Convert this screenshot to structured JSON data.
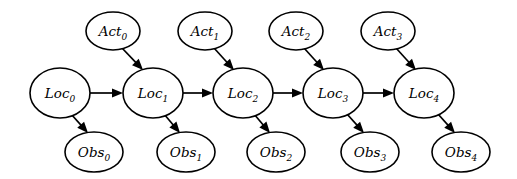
{
  "diagram": {
    "type": "directed-graphical-model",
    "background_color": "#ffffff",
    "stroke_color": "#000000",
    "node_fill": "#ffffff",
    "timesteps": 5
  },
  "nodes": {
    "locations": [
      {
        "id": "loc0",
        "base": "Loc",
        "sub": "0",
        "cx": 60,
        "cy": 93,
        "rx": 30,
        "ry": 25
      },
      {
        "id": "loc1",
        "base": "Loc",
        "sub": "1",
        "cx": 153,
        "cy": 93,
        "rx": 30,
        "ry": 25
      },
      {
        "id": "loc2",
        "base": "Loc",
        "sub": "2",
        "cx": 243,
        "cy": 93,
        "rx": 30,
        "ry": 25
      },
      {
        "id": "loc3",
        "base": "Loc",
        "sub": "3",
        "cx": 333,
        "cy": 93,
        "rx": 30,
        "ry": 25
      },
      {
        "id": "loc4",
        "base": "Loc",
        "sub": "4",
        "cx": 424,
        "cy": 93,
        "rx": 30,
        "ry": 25
      }
    ],
    "actions": [
      {
        "id": "act0",
        "base": "Act",
        "sub": "0",
        "cx": 113,
        "cy": 31,
        "rx": 27,
        "ry": 19
      },
      {
        "id": "act1",
        "base": "Act",
        "sub": "1",
        "cx": 205,
        "cy": 31,
        "rx": 27,
        "ry": 19
      },
      {
        "id": "act2",
        "base": "Act",
        "sub": "2",
        "cx": 296,
        "cy": 31,
        "rx": 27,
        "ry": 19
      },
      {
        "id": "act3",
        "base": "Act",
        "sub": "3",
        "cx": 388,
        "cy": 31,
        "rx": 27,
        "ry": 19
      }
    ],
    "observations": [
      {
        "id": "obs0",
        "base": "Obs",
        "sub": "0",
        "cx": 94,
        "cy": 152,
        "rx": 29,
        "ry": 20
      },
      {
        "id": "obs1",
        "base": "Obs",
        "sub": "1",
        "cx": 186,
        "cy": 152,
        "rx": 29,
        "ry": 20
      },
      {
        "id": "obs2",
        "base": "Obs",
        "sub": "2",
        "cx": 276,
        "cy": 152,
        "rx": 29,
        "ry": 20
      },
      {
        "id": "obs3",
        "base": "Obs",
        "sub": "3",
        "cx": 370,
        "cy": 152,
        "rx": 29,
        "ry": 20
      },
      {
        "id": "obs4",
        "base": "Obs",
        "sub": "4",
        "cx": 461,
        "cy": 152,
        "rx": 29,
        "ry": 20
      }
    ]
  },
  "edges": {
    "transitions": [
      {
        "from": "loc0",
        "to": "loc1",
        "x1": 90,
        "y1": 93,
        "x2": 123,
        "y2": 93
      },
      {
        "from": "loc1",
        "to": "loc2",
        "x1": 183,
        "y1": 93,
        "x2": 213,
        "y2": 93
      },
      {
        "from": "loc2",
        "to": "loc3",
        "x1": 273,
        "y1": 93,
        "x2": 303,
        "y2": 93
      },
      {
        "from": "loc3",
        "to": "loc4",
        "x1": 363,
        "y1": 93,
        "x2": 394,
        "y2": 93
      }
    ],
    "action_to_location": [
      {
        "from": "act0",
        "to": "loc1",
        "x1": 122,
        "y1": 48,
        "x2": 143,
        "y2": 70
      },
      {
        "from": "act1",
        "to": "loc2",
        "x1": 214,
        "y1": 48,
        "x2": 234,
        "y2": 70
      },
      {
        "from": "act2",
        "to": "loc3",
        "x1": 304,
        "y1": 48,
        "x2": 324,
        "y2": 70
      },
      {
        "from": "act3",
        "to": "loc4",
        "x1": 396,
        "y1": 48,
        "x2": 416,
        "y2": 70
      }
    ],
    "location_to_observation": [
      {
        "from": "loc0",
        "to": "obs0",
        "x1": 71,
        "y1": 114,
        "x2": 88,
        "y2": 133
      },
      {
        "from": "loc1",
        "to": "obs1",
        "x1": 164,
        "y1": 114,
        "x2": 180,
        "y2": 133
      },
      {
        "from": "loc2",
        "to": "obs2",
        "x1": 254,
        "y1": 114,
        "x2": 270,
        "y2": 133
      },
      {
        "from": "loc3",
        "to": "obs3",
        "x1": 347,
        "y1": 114,
        "x2": 364,
        "y2": 133
      },
      {
        "from": "loc4",
        "to": "obs4",
        "x1": 438,
        "y1": 114,
        "x2": 455,
        "y2": 133
      }
    ]
  }
}
